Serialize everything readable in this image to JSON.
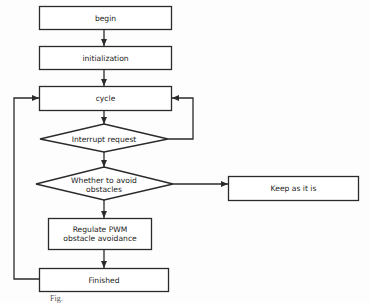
{
  "diagram": {
    "type": "flowchart",
    "nodes": {
      "begin": {
        "label": "begin",
        "shape": "rectangle"
      },
      "initialization": {
        "label": "initialization",
        "shape": "rectangle"
      },
      "cycle": {
        "label": "cycle",
        "shape": "rectangle"
      },
      "interrupt": {
        "label": "Interrupt request",
        "shape": "diamond"
      },
      "avoid": {
        "label": "Whether to avoid obstacles",
        "line1": "Whether to avoid",
        "line2": "obstacles",
        "shape": "diamond"
      },
      "keep": {
        "label": "Keep as it is",
        "shape": "rectangle"
      },
      "regulate": {
        "label": "Regulate PWM obstacle avoidance",
        "line1": "Regulate PWM",
        "line2": "obstacle avoidance",
        "shape": "rectangle"
      },
      "finished": {
        "label": "Finished",
        "shape": "rectangle"
      }
    },
    "edges": [
      {
        "from": "begin",
        "to": "initialization"
      },
      {
        "from": "initialization",
        "to": "cycle"
      },
      {
        "from": "cycle",
        "to": "interrupt"
      },
      {
        "from": "interrupt",
        "to": "cycle",
        "route": "right-loop"
      },
      {
        "from": "interrupt",
        "to": "avoid"
      },
      {
        "from": "avoid",
        "to": "keep"
      },
      {
        "from": "avoid",
        "to": "regulate"
      },
      {
        "from": "regulate",
        "to": "finished"
      },
      {
        "from": "finished",
        "to": "cycle",
        "route": "left-loop"
      }
    ],
    "caption": "Fig."
  },
  "colors": {
    "stroke": "#2a2a2a",
    "text": "#222222",
    "background": "#fdfdfd"
  }
}
